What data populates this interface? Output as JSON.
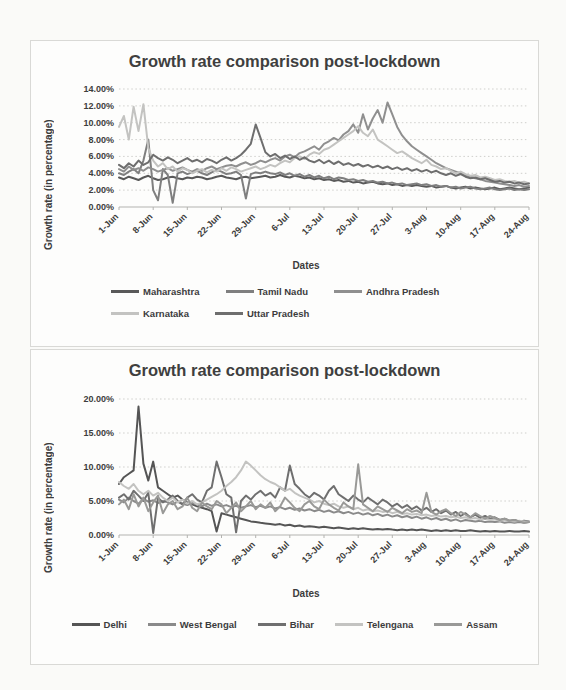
{
  "chart_data": [
    {
      "type": "line",
      "title": "Growth rate comparison post-lockdown",
      "xlabel": "Dates",
      "ylabel": "Growth rate (in percentage)",
      "ylim": [
        0,
        14
      ],
      "ytick_values": [
        0,
        2,
        4,
        6,
        8,
        10,
        12,
        14
      ],
      "y_tick_labels": [
        "0.00%",
        "2.00%",
        "4.00%",
        "6.00%",
        "8.00%",
        "10.00%",
        "12.00%",
        "14.00%"
      ],
      "x_tick_labels": [
        "1-Jun",
        "8-Jun",
        "15-Jun",
        "22-Jun",
        "29-Jun",
        "6-Jul",
        "13-Jul",
        "20-Jul",
        "27-Jul",
        "3-Aug",
        "10-Aug",
        "17-Aug",
        "24-Aug"
      ],
      "tick_every": 7,
      "grid": true,
      "legend_position": "bottom",
      "series": [
        {
          "name": "Maharashtra",
          "color": "#595959",
          "values": [
            3.5,
            3.3,
            3.6,
            3.4,
            3.2,
            3.5,
            3.7,
            3.4,
            3.2,
            3.3,
            3.5,
            3.6,
            3.4,
            3.3,
            3.5,
            3.4,
            3.6,
            3.5,
            3.3,
            3.4,
            3.6,
            3.7,
            3.5,
            3.4,
            3.3,
            3.5,
            3.6,
            3.4,
            3.5,
            3.6,
            3.7,
            3.5,
            3.6,
            3.8,
            3.6,
            3.5,
            3.7,
            3.6,
            3.4,
            3.5,
            3.3,
            3.4,
            3.2,
            3.3,
            3.1,
            3.2,
            3.0,
            3.1,
            2.9,
            3.0,
            2.8,
            2.9,
            3.0,
            2.8,
            2.7,
            2.8,
            2.6,
            2.7,
            2.5,
            2.6,
            2.5,
            2.6,
            2.5,
            2.4,
            2.5,
            2.3,
            2.4,
            2.5,
            2.3,
            2.2,
            2.3,
            2.4,
            2.2,
            2.3,
            2.2,
            2.1,
            2.2,
            2.3,
            2.1,
            2.2,
            2.3,
            2.2,
            2.1,
            2.2,
            2.3
          ]
        },
        {
          "name": "Tamil Nadu",
          "color": "#7f7f7f",
          "values": [
            4.0,
            3.8,
            4.2,
            4.5,
            4.0,
            5.5,
            8.0,
            2.0,
            0.8,
            4.5,
            3.8,
            0.5,
            4.0,
            4.2,
            3.9,
            4.1,
            4.3,
            4.0,
            3.8,
            4.1,
            4.4,
            4.2,
            3.9,
            4.0,
            4.2,
            3.8,
            1.0,
            3.9,
            4.1,
            4.0,
            4.2,
            4.0,
            3.9,
            4.1,
            3.8,
            4.0,
            3.7,
            3.9,
            3.6,
            3.8,
            3.5,
            3.7,
            3.4,
            3.6,
            3.3,
            3.5,
            3.4,
            3.2,
            3.3,
            3.1,
            3.2,
            3.0,
            3.1,
            2.9,
            3.0,
            2.8,
            2.9,
            2.7,
            2.8,
            2.6,
            2.7,
            2.8,
            2.6,
            2.7,
            2.5,
            2.6,
            2.4,
            2.5,
            2.3,
            2.4,
            2.2,
            2.3,
            2.4,
            2.2,
            2.1,
            2.2,
            2.3,
            2.1,
            2.0,
            2.1,
            2.2,
            2.0,
            2.1,
            2.0,
            2.1
          ]
        },
        {
          "name": "Andhra Pradesh",
          "color": "#8f8f8f",
          "values": [
            4.5,
            4.2,
            4.8,
            4.4,
            4.6,
            4.3,
            4.7,
            4.5,
            4.2,
            4.4,
            4.6,
            4.3,
            4.5,
            4.7,
            4.4,
            4.2,
            4.5,
            4.3,
            4.6,
            4.8,
            4.5,
            4.7,
            4.9,
            5.0,
            4.8,
            5.1,
            5.3,
            5.0,
            5.2,
            5.5,
            5.3,
            5.6,
            5.8,
            5.5,
            6.0,
            6.2,
            5.9,
            6.4,
            6.6,
            6.9,
            7.2,
            6.8,
            7.5,
            7.8,
            8.2,
            7.9,
            8.6,
            9.0,
            9.8,
            8.8,
            11.0,
            9.2,
            10.5,
            11.5,
            10.0,
            12.4,
            11.0,
            9.5,
            8.5,
            7.8,
            7.2,
            6.8,
            6.4,
            6.0,
            5.6,
            5.2,
            4.9,
            4.6,
            4.4,
            4.2,
            4.0,
            3.8,
            3.6,
            3.4,
            3.3,
            3.1,
            3.0,
            2.9,
            2.8,
            2.7,
            2.6,
            2.5,
            2.6,
            2.4,
            2.5
          ]
        },
        {
          "name": "Karnataka",
          "color": "#c3c3c1",
          "values": [
            9.5,
            10.8,
            8.0,
            11.9,
            9.0,
            12.2,
            7.0,
            5.5,
            4.8,
            5.2,
            4.5,
            4.8,
            4.2,
            4.6,
            4.4,
            4.0,
            4.3,
            4.5,
            4.1,
            4.4,
            4.2,
            4.6,
            4.3,
            4.7,
            4.5,
            4.2,
            4.4,
            4.6,
            4.8,
            4.5,
            4.7,
            5.0,
            4.8,
            5.2,
            5.5,
            5.3,
            5.8,
            6.0,
            5.7,
            6.2,
            6.5,
            6.3,
            6.8,
            7.0,
            7.4,
            7.8,
            8.2,
            8.6,
            9.0,
            9.6,
            8.8,
            8.4,
            9.2,
            8.0,
            7.6,
            7.2,
            6.8,
            6.4,
            6.6,
            6.2,
            5.8,
            5.5,
            5.2,
            5.6,
            5.0,
            4.8,
            4.5,
            4.6,
            4.3,
            4.0,
            4.2,
            3.9,
            3.7,
            3.8,
            3.5,
            3.6,
            3.4,
            3.2,
            3.3,
            3.1,
            3.0,
            3.1,
            2.9,
            3.0,
            2.8
          ]
        },
        {
          "name": "Uttar Pradesh",
          "color": "#6e6e6e",
          "values": [
            5.0,
            4.6,
            5.2,
            4.8,
            5.5,
            5.0,
            5.3,
            6.2,
            5.8,
            5.5,
            5.9,
            5.6,
            5.2,
            5.5,
            5.8,
            5.4,
            5.6,
            5.3,
            5.7,
            5.5,
            5.2,
            5.6,
            5.9,
            5.5,
            5.8,
            6.2,
            6.8,
            7.5,
            9.8,
            8.2,
            6.5,
            6.0,
            6.3,
            5.8,
            6.1,
            5.7,
            6.0,
            5.6,
            5.9,
            5.5,
            5.3,
            5.6,
            5.2,
            5.5,
            5.1,
            5.4,
            5.0,
            5.2,
            4.9,
            5.1,
            4.8,
            5.0,
            4.7,
            4.9,
            4.6,
            4.8,
            4.5,
            4.7,
            4.4,
            4.6,
            4.3,
            4.5,
            4.2,
            4.4,
            4.1,
            4.3,
            4.0,
            3.8,
            4.0,
            3.7,
            3.9,
            3.6,
            3.4,
            3.5,
            3.3,
            3.4,
            3.2,
            3.0,
            3.1,
            2.9,
            3.0,
            2.8,
            2.9,
            2.7,
            2.8
          ]
        }
      ]
    },
    {
      "type": "line",
      "title": "Growth rate comparison post-lockdown",
      "xlabel": "Dates",
      "ylabel": "Growth rate (in percentage)",
      "ylim": [
        0,
        20
      ],
      "ytick_values": [
        0,
        5,
        10,
        15,
        20
      ],
      "y_tick_labels": [
        "0.00%",
        "5.00%",
        "10.00%",
        "15.00%",
        "20.00%"
      ],
      "x_tick_labels": [
        "1-Jun",
        "8-Jun",
        "15-Jun",
        "22-Jun",
        "29-Jun",
        "6-Jul",
        "13-Jul",
        "20-Jul",
        "27-Jul",
        "3-Aug",
        "10-Aug",
        "17-Aug",
        "24-Aug"
      ],
      "tick_every": 7,
      "grid": true,
      "legend_position": "bottom",
      "series": [
        {
          "name": "Delhi",
          "color": "#555555",
          "values": [
            7.5,
            8.5,
            9.0,
            9.5,
            18.9,
            10.5,
            8.0,
            10.8,
            7.0,
            6.5,
            6.0,
            5.5,
            5.8,
            5.2,
            4.8,
            4.5,
            4.2,
            4.0,
            3.8,
            3.5,
            0.5,
            3.2,
            3.0,
            2.8,
            2.6,
            2.4,
            2.2,
            2.0,
            1.9,
            1.8,
            1.7,
            1.6,
            1.5,
            1.6,
            1.4,
            1.5,
            1.3,
            1.4,
            1.2,
            1.3,
            1.2,
            1.1,
            1.2,
            1.1,
            1.0,
            1.1,
            1.0,
            0.9,
            1.0,
            0.9,
            1.0,
            0.9,
            0.8,
            0.9,
            0.8,
            0.9,
            0.8,
            0.7,
            0.8,
            0.7,
            0.8,
            0.7,
            0.8,
            0.7,
            0.6,
            0.7,
            0.6,
            0.7,
            0.6,
            0.7,
            0.6,
            0.6,
            0.7,
            0.6,
            0.5,
            0.6,
            0.5,
            0.6,
            0.5,
            0.5,
            0.6,
            0.5,
            0.5,
            0.6,
            0.5
          ]
        },
        {
          "name": "West Bengal",
          "color": "#8a8a8a",
          "values": [
            5.2,
            4.8,
            5.5,
            5.0,
            4.6,
            5.3,
            4.9,
            5.1,
            4.7,
            5.0,
            4.8,
            4.5,
            4.9,
            4.6,
            4.4,
            4.7,
            4.5,
            4.2,
            4.6,
            4.3,
            4.5,
            4.2,
            4.4,
            4.1,
            4.3,
            4.0,
            4.2,
            4.4,
            4.1,
            4.3,
            4.0,
            4.2,
            3.9,
            4.1,
            3.8,
            4.0,
            3.7,
            3.9,
            3.6,
            3.8,
            3.5,
            3.7,
            3.4,
            3.6,
            3.3,
            3.5,
            3.2,
            3.4,
            3.1,
            3.3,
            3.0,
            3.2,
            2.9,
            3.1,
            2.8,
            3.0,
            2.7,
            2.9,
            2.6,
            2.8,
            2.5,
            2.7,
            2.4,
            2.6,
            2.3,
            2.5,
            2.2,
            2.4,
            2.1,
            2.3,
            2.0,
            2.2,
            2.1,
            2.0,
            2.1,
            1.9,
            2.0,
            1.9,
            2.0,
            1.8,
            1.9,
            1.8,
            1.9,
            1.8,
            1.9
          ]
        },
        {
          "name": "Bihar",
          "color": "#6f6f6f",
          "values": [
            5.5,
            6.0,
            5.2,
            6.5,
            5.8,
            5.0,
            6.2,
            0.3,
            5.5,
            4.8,
            5.2,
            5.8,
            5.0,
            4.5,
            5.5,
            6.0,
            5.2,
            4.8,
            6.5,
            7.0,
            10.8,
            8.5,
            6.0,
            5.5,
            0.4,
            5.0,
            5.8,
            5.2,
            6.0,
            6.5,
            5.8,
            6.2,
            5.5,
            7.0,
            6.5,
            10.2,
            7.5,
            6.8,
            6.0,
            5.5,
            6.2,
            5.8,
            5.2,
            6.5,
            7.2,
            6.0,
            5.5,
            5.0,
            5.8,
            5.2,
            4.8,
            5.5,
            5.0,
            4.5,
            5.2,
            4.8,
            4.2,
            4.6,
            4.0,
            4.4,
            3.8,
            4.2,
            3.6,
            4.0,
            3.4,
            3.8,
            3.2,
            3.6,
            3.0,
            3.4,
            2.8,
            3.2,
            2.6,
            3.0,
            2.5,
            2.8,
            2.4,
            2.6,
            2.2,
            2.4,
            2.1,
            2.2,
            2.0,
            2.1,
            2.0
          ]
        },
        {
          "name": "Telengana",
          "color": "#c3c3c1",
          "values": [
            7.8,
            7.2,
            6.8,
            7.5,
            6.5,
            6.0,
            6.5,
            5.8,
            6.2,
            5.5,
            5.0,
            5.5,
            4.8,
            5.2,
            4.6,
            5.0,
            4.5,
            4.8,
            5.2,
            5.6,
            6.0,
            6.5,
            7.2,
            7.8,
            8.5,
            9.5,
            10.8,
            10.2,
            9.5,
            8.8,
            8.2,
            7.8,
            7.5,
            7.0,
            6.5,
            6.8,
            6.2,
            5.8,
            5.5,
            5.2,
            4.8,
            5.0,
            4.6,
            4.4,
            4.6,
            4.2,
            4.0,
            4.2,
            3.8,
            4.0,
            3.6,
            3.8,
            3.5,
            3.6,
            3.4,
            3.5,
            3.2,
            3.4,
            3.1,
            3.2,
            3.0,
            3.1,
            2.9,
            3.0,
            2.8,
            2.9,
            2.7,
            2.8,
            2.6,
            2.7,
            2.5,
            2.6,
            2.4,
            2.5,
            2.3,
            2.4,
            2.2,
            2.3,
            2.1,
            2.2,
            2.1,
            2.0,
            2.1,
            2.0,
            1.9
          ]
        },
        {
          "name": "Assam",
          "color": "#999997",
          "values": [
            4.5,
            5.2,
            3.8,
            6.0,
            4.2,
            5.5,
            3.5,
            4.8,
            5.8,
            3.2,
            4.5,
            5.0,
            3.8,
            4.2,
            5.5,
            4.0,
            3.5,
            4.8,
            4.2,
            3.8,
            5.0,
            4.5,
            3.2,
            4.0,
            4.8,
            3.5,
            4.2,
            5.0,
            3.8,
            4.5,
            4.0,
            4.8,
            3.5,
            4.2,
            5.5,
            4.8,
            4.0,
            3.5,
            4.5,
            5.0,
            4.2,
            3.8,
            5.2,
            4.5,
            4.0,
            3.6,
            4.8,
            4.2,
            3.8,
            10.4,
            4.5,
            4.0,
            3.5,
            4.2,
            3.8,
            3.4,
            4.0,
            3.6,
            3.2,
            3.8,
            3.4,
            3.6,
            3.2,
            6.2,
            3.4,
            3.0,
            3.5,
            3.8,
            3.2,
            2.8,
            3.4,
            3.0,
            2.6,
            3.2,
            2.8,
            2.4,
            2.8,
            2.5,
            2.2,
            2.4,
            2.1,
            2.2,
            2.0,
            1.8,
            1.9
          ]
        }
      ]
    }
  ]
}
